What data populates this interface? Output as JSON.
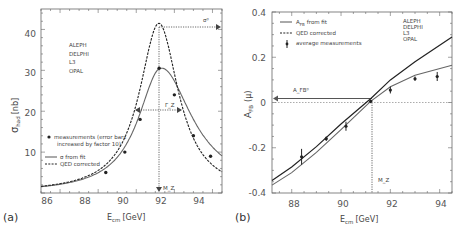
{
  "chart_data": [
    {
      "panel": "(a)",
      "type": "line",
      "title": "",
      "xlabel": "E_cm [GeV]",
      "ylabel": "σ_had [nb]",
      "xlim": [
        85,
        94.5
      ],
      "ylim": [
        0,
        45
      ],
      "xticks": [
        86,
        88,
        90,
        92,
        94
      ],
      "yticks": [
        10,
        20,
        30,
        40
      ],
      "grid": false,
      "legend_position": "middle-left",
      "experiments": [
        "ALEPH",
        "DELPHI",
        "L3",
        "OPAL"
      ],
      "legend": [
        "measurements (error bars increased by factor 10)",
        "σ from fit",
        "QED corrected"
      ],
      "annotations": [
        "σ⁰",
        "Γ_Z",
        "M_Z"
      ],
      "series": [
        {
          "name": "measurements",
          "style": "points",
          "x": [
            88.4,
            89.4,
            90.2,
            91.2,
            92.0,
            93.0,
            93.9
          ],
          "y": [
            5.0,
            10.0,
            18.0,
            30.5,
            24.0,
            14.0,
            9.0
          ]
        },
        {
          "name": "σ from fit",
          "style": "solid",
          "peak_x": 91.2,
          "peak_y": 30.5
        },
        {
          "name": "QED corrected",
          "style": "dashed",
          "peak_x": 91.2,
          "peak_y": 41.5
        }
      ],
      "markers": {
        "M_Z": 91.19,
        "sigma0": 41.5,
        "half_max": 21.0,
        "gamma_left": 89.95,
        "gamma_right": 92.45
      }
    },
    {
      "panel": "(b)",
      "type": "line",
      "title": "",
      "xlabel": "E_cm [GeV]",
      "ylabel": "A_FB (μ)",
      "xlim": [
        87.2,
        94.5
      ],
      "ylim": [
        -0.4,
        0.4
      ],
      "xticks": [
        88,
        90,
        92,
        94
      ],
      "yticks": [
        -0.4,
        -0.2,
        0,
        0.2,
        0.4
      ],
      "grid": false,
      "legend_position": "top-left",
      "experiments": [
        "ALEPH",
        "DELPHI",
        "L3",
        "OPAL"
      ],
      "legend": [
        "A_FB from fit",
        "QED corrected",
        "average measurements"
      ],
      "annotations": [
        "A_FB⁰",
        "M_Z"
      ],
      "series": [
        {
          "name": "average measurements",
          "style": "points",
          "x": [
            88.4,
            89.4,
            90.2,
            91.2,
            92.0,
            93.0,
            93.9
          ],
          "y": [
            -0.24,
            -0.16,
            -0.105,
            0.005,
            0.055,
            0.105,
            0.115
          ]
        },
        {
          "name": "A_FB from fit",
          "style": "solid",
          "x": [
            87.2,
            88,
            89,
            90,
            91.2,
            92,
            93,
            94.5
          ],
          "y": [
            -0.365,
            -0.31,
            -0.22,
            -0.12,
            0.005,
            0.07,
            0.12,
            0.165
          ]
        },
        {
          "name": "QED corrected",
          "style": "dashed",
          "x": [
            87.2,
            88,
            89,
            90,
            91.2,
            92,
            93,
            94.5
          ],
          "y": [
            -0.345,
            -0.285,
            -0.195,
            -0.095,
            0.017,
            0.1,
            0.18,
            0.29
          ]
        }
      ],
      "markers": {
        "M_Z": 91.19,
        "A_FB0": 0.017
      }
    }
  ],
  "panel_a": {
    "label": "(a)",
    "ylabel_main": "σ",
    "ylabel_sub": "had",
    "ylabel_unit": "[nb]",
    "xlabel_main": "E",
    "xlabel_sub": "cm",
    "xlabel_unit": "[GeV]",
    "experiments": [
      "ALEPH",
      "DELPHI",
      "L3",
      "OPAL"
    ],
    "legend_meas_1": "measurements (error bars",
    "legend_meas_2": "increased by factor 10)",
    "legend_fit": "σ from fit",
    "legend_qed": "QED corrected",
    "ann_sigma0": "σ⁰",
    "ann_gamma": "Γ_Z",
    "ann_mz": "M_Z",
    "xticks": [
      "86",
      "88",
      "90",
      "92",
      "94"
    ],
    "yticks": [
      "10",
      "20",
      "30",
      "40"
    ]
  },
  "panel_b": {
    "label": "(b)",
    "ylabel_main": "A",
    "ylabel_sub": "FB",
    "ylabel_unit": "(μ)",
    "xlabel_main": "E",
    "xlabel_sub": "cm",
    "xlabel_unit": "[GeV]",
    "experiments": [
      "ALEPH",
      "DELPHI",
      "L3",
      "OPAL"
    ],
    "legend_fit": "from fit",
    "legend_qed": "QED corrected",
    "legend_meas": "average measurements",
    "ann_afb0": "A_FB⁰",
    "ann_mz": "M_Z",
    "xticks": [
      "88",
      "90",
      "92",
      "94"
    ],
    "yticks": [
      "0.4",
      "0.2",
      "0",
      "-0.2",
      "-0.4"
    ]
  }
}
